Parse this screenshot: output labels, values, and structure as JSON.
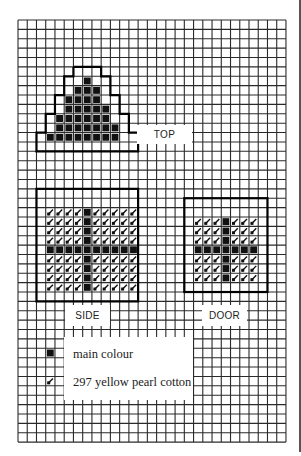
{
  "grid": {
    "cols": 29,
    "rows": 45,
    "cell_w": 9.24,
    "cell_h": 9.38,
    "line_color": "#2a2a2a",
    "fill_color": "#111111"
  },
  "stitch_symbols": {
    "main": "solid-black-square",
    "yellow": "diagonal-stitch"
  },
  "sections": [
    {
      "name": "top",
      "label": "TOP",
      "rows": [
        {
          "row": 6,
          "main": [
            7
          ]
        },
        {
          "row": 7,
          "main": [
            6,
            7,
            8
          ]
        },
        {
          "row": 8,
          "main": [
            5,
            6,
            7,
            8
          ]
        },
        {
          "row": 9,
          "main": [
            5,
            6,
            7,
            8,
            9
          ]
        },
        {
          "row": 10,
          "main": [
            4,
            5,
            6,
            7,
            8,
            9
          ]
        },
        {
          "row": 11,
          "main": [
            4,
            5,
            6,
            7,
            8,
            9,
            10
          ]
        },
        {
          "row": 12,
          "main": [
            3,
            4,
            5,
            6,
            7,
            8,
            9,
            10
          ]
        }
      ],
      "outline": [
        [
          6,
          5
        ],
        [
          9,
          5
        ],
        [
          9,
          6
        ],
        [
          10,
          6
        ],
        [
          10,
          8
        ],
        [
          11,
          8
        ],
        [
          11,
          10
        ],
        [
          12,
          10
        ],
        [
          12,
          12
        ],
        [
          13,
          12
        ],
        [
          13,
          14
        ],
        [
          2,
          14
        ],
        [
          2,
          12
        ],
        [
          3,
          12
        ],
        [
          3,
          10
        ],
        [
          4,
          10
        ],
        [
          4,
          8
        ],
        [
          5,
          8
        ],
        [
          5,
          6
        ],
        [
          6,
          6
        ],
        [
          6,
          5
        ]
      ]
    },
    {
      "name": "side",
      "label": "SIDE",
      "box": [
        2,
        18,
        13,
        30
      ],
      "fill_cols": [
        3,
        12
      ],
      "fill_rows": [
        20,
        28
      ],
      "cross_col": 7,
      "cross_row": 24
    },
    {
      "name": "door",
      "label": "DOOR",
      "box": [
        18,
        19,
        27,
        29
      ],
      "fill_cols": [
        19,
        25
      ],
      "fill_rows": [
        21,
        27
      ],
      "cross_col": 22,
      "cross_row": 24
    }
  ],
  "labels": {
    "top": "TOP",
    "side": "SIDE",
    "door": "DOOR"
  },
  "legend": {
    "items": [
      {
        "symbol": "solid-black-square",
        "text": "main colour"
      },
      {
        "symbol": "diagonal-stitch",
        "text": "297 yellow pearl cotton"
      }
    ]
  }
}
